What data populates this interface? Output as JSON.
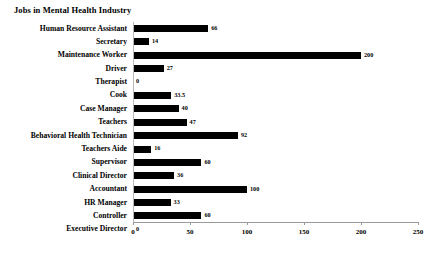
{
  "chart_data": {
    "type": "bar",
    "orientation": "horizontal",
    "title": "Jobs in Mental Health Industry",
    "xlabel": "",
    "ylabel": "",
    "xlim": [
      0,
      250
    ],
    "xticks": [
      0,
      50,
      100,
      150,
      200,
      250
    ],
    "grid": false,
    "legend": false,
    "bar_color": "#000000",
    "categories": [
      "Human Resource Assistant",
      "Secretary",
      "Maintenance Worker",
      "Driver",
      "Therapist",
      "Cook",
      "Case Manager",
      "Teachers",
      "Behavioral Health Technician",
      "Teachers Aide",
      "Supervisor",
      "Clinical Director",
      "Accountant",
      "HR Manager",
      "Controller",
      "Executive Director"
    ],
    "values": [
      66,
      14,
      200,
      27,
      0,
      33.5,
      40,
      47,
      92,
      16,
      60,
      36,
      100,
      33,
      60,
      0
    ],
    "value_labels": [
      "66",
      "14",
      "200",
      "27",
      "0",
      "33.5",
      "40",
      "47",
      "92",
      "16",
      "60",
      "36",
      "100",
      "33",
      "60",
      "0"
    ],
    "tick_labels": [
      "0",
      "50",
      "100",
      "150",
      "200",
      "250"
    ]
  }
}
